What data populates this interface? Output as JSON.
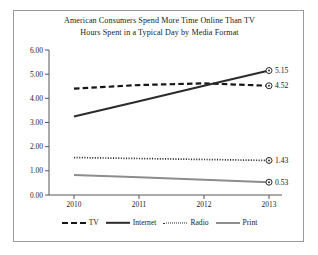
{
  "chart_data": {
    "type": "line",
    "title": "American Consumers Spend More Time Online Than TV",
    "subtitle": "Hours Spent in a Typical Day by Media Format",
    "xlabel": "",
    "ylabel": "",
    "categories": [
      "2010",
      "2011",
      "2012",
      "2013"
    ],
    "x": [
      2010,
      2011,
      2012,
      2013
    ],
    "ylim": [
      0.0,
      6.0
    ],
    "ytick_labels": [
      "0.00",
      "1.00",
      "2.00",
      "3.00",
      "4.00",
      "5.00",
      "6.00"
    ],
    "ytick_values": [
      0.0,
      1.0,
      2.0,
      3.0,
      4.0,
      5.0,
      6.0
    ],
    "grid": false,
    "legend_position": "bottom",
    "series": [
      {
        "name": "TV",
        "style": "dashed",
        "color": "#161616",
        "values": [
          4.4,
          4.55,
          4.62,
          4.52
        ],
        "end_label": "4.52"
      },
      {
        "name": "Internet",
        "style": "solid",
        "color": "#2b2b2b",
        "values": [
          3.25,
          3.88,
          4.52,
          5.15
        ],
        "end_label": "5.15"
      },
      {
        "name": "Radio",
        "style": "dotted",
        "color": "#2e2e2e",
        "values": [
          1.55,
          1.51,
          1.47,
          1.43
        ],
        "end_label": "1.43"
      },
      {
        "name": "Print",
        "style": "solid",
        "color": "#8d8d8d",
        "values": [
          0.83,
          0.73,
          0.63,
          0.53
        ],
        "end_label": "0.53"
      }
    ]
  },
  "titles": {
    "main": "American Consumers Spend More Time Online Than TV",
    "sub": "Hours Spent in a Typical Day by Media Format"
  },
  "axes": {
    "y_labels": [
      "6.00",
      "5.00",
      "4.00",
      "3.00",
      "2.00",
      "1.00",
      "0.00"
    ],
    "x_labels": [
      "2010",
      "2011",
      "2012",
      "2013"
    ]
  },
  "value_labels": {
    "internet": "5.15",
    "tv": "4.52",
    "radio": "1.43",
    "print": "0.53"
  },
  "legend": {
    "items": [
      {
        "label": "TV"
      },
      {
        "label": "Internet"
      },
      {
        "label": "Radio"
      },
      {
        "label": "Print"
      }
    ]
  }
}
